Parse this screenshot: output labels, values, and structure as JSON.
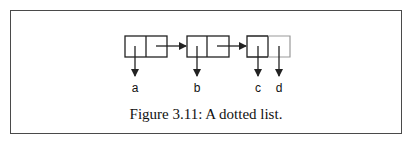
{
  "figure": {
    "caption": "Figure 3.11: A dotted list.",
    "cells": [
      {
        "car_target": "a",
        "cdr": "pointer-to-next"
      },
      {
        "car_target": "b",
        "cdr": "pointer-to-next"
      },
      {
        "car_target": "c",
        "cdr_target": "d"
      }
    ],
    "labels": [
      "a",
      "b",
      "c",
      "d"
    ],
    "colors": {
      "stroke": "#222222",
      "frame": "#4a4a4a",
      "background": "#ffffff"
    }
  }
}
